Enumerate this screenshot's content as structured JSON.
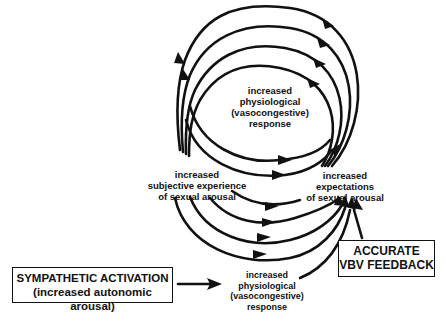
{
  "diagram": {
    "type": "feedback-loop flow diagram",
    "nodes": {
      "top_response": {
        "lines": [
          "increased",
          "physiological",
          "(vasocongestive)",
          "response"
        ]
      },
      "subjective": {
        "lines": [
          "increased",
          "subjective experience",
          "of sexual arousal"
        ]
      },
      "expectations": {
        "lines": [
          "increased",
          "expectations",
          "of sexual arousal"
        ]
      },
      "bottom_response": {
        "lines": [
          "increased",
          "physiological",
          "(vasocongestive)",
          "response"
        ]
      },
      "sympathetic_box": {
        "lines": [
          "SYMPATHETIC ACTIVATION",
          "(increased autonomic arousal)"
        ]
      },
      "vbv_box": {
        "lines": [
          "ACCURATE",
          "VBV FEEDBACK"
        ]
      }
    },
    "edges": [
      {
        "from": "sympathetic_box",
        "to": "bottom_response",
        "style": "straight-arrow"
      },
      {
        "from": "bottom_response",
        "to": "expectations",
        "style": "curved-arrow"
      },
      {
        "from": "vbv_box",
        "to": "expectations",
        "style": "straight-arrow"
      },
      {
        "from": "expectations",
        "to": "subjective",
        "style": "looping-arcs-over-top",
        "count": 4
      },
      {
        "from": "subjective",
        "to": "expectations",
        "style": "curved-arrows-below",
        "count": 6
      }
    ],
    "colors": {
      "stroke": "#111111",
      "background": "#ffffff"
    }
  }
}
